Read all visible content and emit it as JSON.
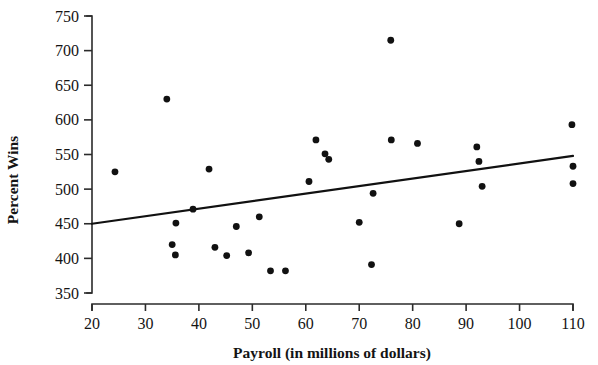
{
  "chart_data": {
    "type": "scatter",
    "title": "",
    "xlabel": "Payroll (in millions of dollars)",
    "ylabel": "Percent Wins",
    "xlim": [
      20,
      110
    ],
    "ylim": [
      350,
      750
    ],
    "xticks": [
      20,
      30,
      40,
      50,
      60,
      70,
      80,
      90,
      100,
      110
    ],
    "yticks": [
      350,
      400,
      450,
      500,
      550,
      600,
      650,
      700,
      750
    ],
    "grid": false,
    "legend": "none",
    "marker_color": "#111111",
    "points": [
      {
        "x": 24.3,
        "y": 525
      },
      {
        "x": 34.0,
        "y": 630
      },
      {
        "x": 35.0,
        "y": 420
      },
      {
        "x": 35.6,
        "y": 405
      },
      {
        "x": 35.7,
        "y": 451
      },
      {
        "x": 38.9,
        "y": 471
      },
      {
        "x": 41.9,
        "y": 529
      },
      {
        "x": 43.0,
        "y": 416
      },
      {
        "x": 45.2,
        "y": 404
      },
      {
        "x": 47.0,
        "y": 446
      },
      {
        "x": 49.3,
        "y": 408
      },
      {
        "x": 51.3,
        "y": 460
      },
      {
        "x": 53.4,
        "y": 382
      },
      {
        "x": 56.2,
        "y": 382
      },
      {
        "x": 60.6,
        "y": 511
      },
      {
        "x": 61.9,
        "y": 571
      },
      {
        "x": 63.6,
        "y": 551
      },
      {
        "x": 64.3,
        "y": 543
      },
      {
        "x": 70.0,
        "y": 452
      },
      {
        "x": 72.3,
        "y": 391
      },
      {
        "x": 72.6,
        "y": 494
      },
      {
        "x": 75.9,
        "y": 715
      },
      {
        "x": 76.0,
        "y": 571
      },
      {
        "x": 80.9,
        "y": 566
      },
      {
        "x": 88.7,
        "y": 450
      },
      {
        "x": 92.0,
        "y": 561
      },
      {
        "x": 92.4,
        "y": 540
      },
      {
        "x": 93.0,
        "y": 504
      },
      {
        "x": 109.8,
        "y": 593
      },
      {
        "x": 110.0,
        "y": 533
      },
      {
        "x": 110.0,
        "y": 508
      }
    ],
    "trend_line": {
      "type": "linear-fit",
      "x_start": 20,
      "y_start": 450,
      "x_end": 110,
      "y_end": 548
    }
  }
}
